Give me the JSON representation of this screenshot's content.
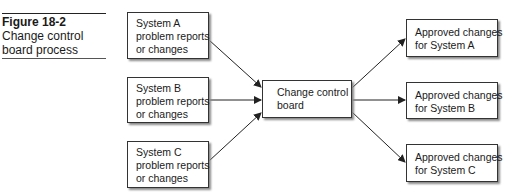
{
  "figure": {
    "number": "Figure 18-2",
    "title_line1": "Change control",
    "title_line2": "board process"
  },
  "inputs": [
    {
      "line1": "System A",
      "line2": "problem reports",
      "line3": "or changes"
    },
    {
      "line1": "System B",
      "line2": "problem reports",
      "line3": "or changes"
    },
    {
      "line1": "System C",
      "line2": "problem reports",
      "line3": "or changes"
    }
  ],
  "center": {
    "line1": "Change control",
    "line2": "board"
  },
  "outputs": [
    {
      "line1": "Approved changes",
      "line2": "for System A"
    },
    {
      "line1": "Approved changes",
      "line2": "for System B"
    },
    {
      "line1": "Approved changes",
      "line2": "for System C"
    }
  ],
  "colors": {
    "line": "#222222",
    "box_border": "#333333",
    "shadow": "#8a8a8a"
  }
}
